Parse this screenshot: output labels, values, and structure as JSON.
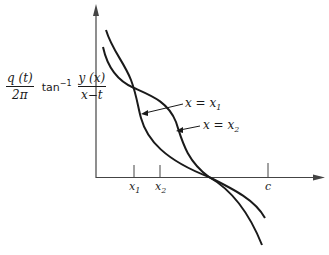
{
  "figure": {
    "y_axis_label": {
      "numerator_left": "q (t)",
      "denominator_left": "2π",
      "function": "tan",
      "function_exponent": "−1",
      "numerator_right": "y (x)",
      "denominator_right": "x−t"
    },
    "curve_labels": [
      {
        "var": "x = x",
        "sub": "1"
      },
      {
        "var": "x = x",
        "sub": "2"
      }
    ],
    "x_ticks": [
      {
        "var": "x",
        "sub": "1"
      },
      {
        "var": "x",
        "sub": "2"
      },
      {
        "var": "c",
        "sub": ""
      }
    ],
    "colors": {
      "ink": "#1a1a1a",
      "axis": "#444444",
      "background": "#ffffff"
    }
  }
}
